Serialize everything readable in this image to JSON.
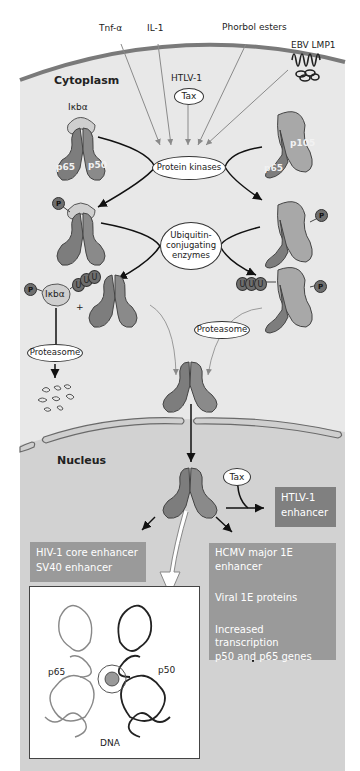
{
  "signals": {
    "tnf": "Tnf-α",
    "il1": "IL-1",
    "phorbol": "Phorbol esters",
    "ebv": "EBV LMP1",
    "htlv": "HTLV-1",
    "tax": "Tax"
  },
  "compartments": {
    "cytoplasm": "Cytoplasm",
    "nucleus": "Nucleus"
  },
  "proteins": {
    "ikba": "Iκbα",
    "p65": "p65",
    "p50": "p50",
    "p105": "p105",
    "phospho": "P",
    "ubiquitin": "U",
    "plus": "+"
  },
  "enzymes": {
    "kinases": "Protein kinases",
    "ubiquitin_line1": "Ubiquitin-",
    "ubiquitin_line2": "conjugating",
    "ubiquitin_line3": "enzymes",
    "proteasome": "Proteasome"
  },
  "nuclear": {
    "tax": "Tax",
    "htlv_box_line1": "HTLV-1",
    "htlv_box_line2": "enhancer",
    "hiv_box_line1": "HIV-1 core enhancer",
    "hiv_box_line2": "SV40 enhancer",
    "hcmv_line1": "HCMV major 1E",
    "hcmv_line2": "enhancer",
    "viral": "Viral 1E proteins",
    "increased_line1": "Increased transcription",
    "increased_line2": "p50 and p65 genes"
  },
  "structure": {
    "p65": "p65",
    "p50": "p50",
    "dna": "DNA"
  },
  "colors": {
    "cytoplasm_bg": "#e6e6e6",
    "nucleus_bg": "#cfcfcf",
    "membrane": "#7a7a7a",
    "protein_dark": "#7d7d7d",
    "protein_light": "#a8a8a8",
    "box_fill": "#9a9a9a"
  }
}
